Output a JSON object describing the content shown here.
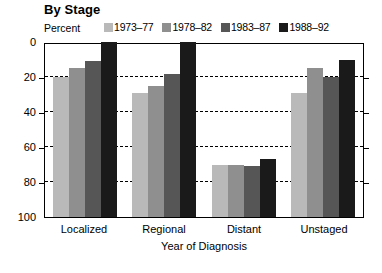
{
  "title": "By Stage",
  "y_axis_caption": "Percent",
  "x_axis_title": "Year of Diagnosis",
  "legend": [
    {
      "label": "1973–77",
      "color": "#b9b9b9"
    },
    {
      "label": "1978–82",
      "color": "#8f8f8f"
    },
    {
      "label": "1983–87",
      "color": "#565656"
    },
    {
      "label": "1988–92",
      "color": "#1a1a1a"
    }
  ],
  "y_ticks": [
    "100",
    "80",
    "60",
    "40",
    "20",
    "0"
  ],
  "chart_data": {
    "type": "bar",
    "title": "By Stage",
    "xlabel": "Year of Diagnosis",
    "ylabel": "Percent",
    "ylim": [
      0,
      100
    ],
    "yticks": [
      0,
      20,
      40,
      60,
      80,
      100
    ],
    "grid": true,
    "grid_axis": "y",
    "legend_position": "top",
    "categories": [
      "Localized",
      "Regional",
      "Distant",
      "Unstaged"
    ],
    "series": [
      {
        "name": "1973–77",
        "color": "#b9b9b9",
        "values": [
          80,
          71,
          30,
          71
        ]
      },
      {
        "name": "1978–82",
        "color": "#8f8f8f",
        "values": [
          85,
          75,
          30,
          85
        ]
      },
      {
        "name": "1983–87",
        "color": "#565656",
        "values": [
          89,
          82,
          29,
          80
        ]
      },
      {
        "name": "1988–92",
        "color": "#1a1a1a",
        "values": [
          100,
          100,
          33,
          90
        ]
      }
    ]
  }
}
